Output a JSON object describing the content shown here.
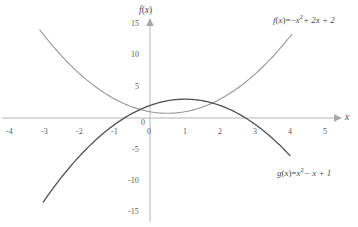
{
  "chart_data": {
    "type": "line",
    "title": "",
    "xlabel": "x",
    "ylabel": "f(x)",
    "xlim": [
      -4.5,
      5.5
    ],
    "ylim": [
      -16,
      16
    ],
    "grid": false,
    "legend_position": "inline-annotations",
    "x_ticks": [
      -4,
      -3,
      -2,
      -1,
      0,
      1,
      2,
      3,
      4,
      5
    ],
    "x_tick_labels": [
      "-4",
      "-3",
      "-2",
      "-1",
      "0",
      "1",
      "2",
      "3",
      "4",
      "5"
    ],
    "y_ticks": [
      -15,
      -10,
      -5,
      0,
      5,
      10,
      15
    ],
    "y_tick_labels": [
      "-15",
      "-10",
      "-5",
      "0",
      "5",
      "10",
      "15"
    ],
    "series": [
      {
        "name": "f",
        "equation": "f(x) = -x^2 + 2x + 2",
        "color": "#555555",
        "domain": [
          -3.05,
          4.0
        ],
        "coefficients": {
          "a": -1,
          "b": 2,
          "c": 2
        },
        "vertex": [
          1,
          3
        ],
        "x_intercepts": [
          -0.732,
          2.732
        ],
        "y_intercept": 2
      },
      {
        "name": "g",
        "equation": "g(x) = x^2 - x + 1",
        "color": "#9a9a9a",
        "domain": [
          -3.15,
          4.05
        ],
        "coefficients": {
          "a": 1,
          "b": -1,
          "c": 1
        },
        "vertex": [
          0.5,
          0.75
        ],
        "x_intercepts": [],
        "y_intercept": 1
      }
    ],
    "intersections": [
      [
        -0.281,
        1.36
      ],
      [
        1.781,
        2.391
      ]
    ]
  },
  "axes": {
    "x_axis_title": "x",
    "y_axis_title_prefix": "f",
    "y_axis_title_open": "(",
    "y_axis_title_var": "x",
    "y_axis_title_close": ")",
    "origin_label": "0",
    "x_origin_label": "0",
    "axis_color": "#b5b5b5"
  },
  "ticks": {
    "x": [
      {
        "label": "-4",
        "value": -4
      },
      {
        "label": "-3",
        "value": -3
      },
      {
        "label": "-2",
        "value": -2
      },
      {
        "label": "-1",
        "value": -1
      },
      {
        "label": "1",
        "value": 1
      },
      {
        "label": "2",
        "value": 2
      },
      {
        "label": "3",
        "value": 3
      },
      {
        "label": "4",
        "value": 4
      },
      {
        "label": "5",
        "value": 5
      }
    ],
    "y": [
      {
        "label": "15",
        "value": 15
      },
      {
        "label": "10",
        "value": 10
      },
      {
        "label": "5",
        "value": 5
      },
      {
        "label": "-5",
        "value": -5
      },
      {
        "label": "-10",
        "value": -10
      },
      {
        "label": "-15",
        "value": -15
      }
    ]
  },
  "annotations": {
    "f_label": {
      "fn": "f",
      "open": "(",
      "var": "x",
      "close": ")",
      "eq": "=",
      "minus": "−",
      "base": "x",
      "exp": "2",
      "rest": "+ 2x + 2"
    },
    "g_label": {
      "fn": "g",
      "open": "(",
      "var": "x",
      "close": ")",
      "eq": "=",
      "base": "x",
      "exp": "2",
      "rest": "− x + 1"
    }
  }
}
